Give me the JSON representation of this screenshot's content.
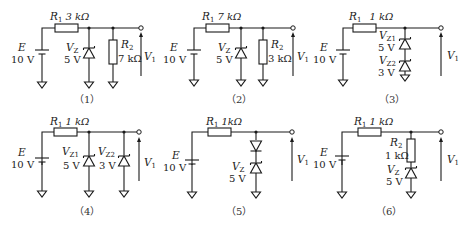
{
  "circuits": [
    {
      "caption": "（1）",
      "E_label": "E",
      "E_value": "10 V",
      "R1_label": "R",
      "R1_sub": "1",
      "R1_value": "3 kΩ",
      "Z_label": "V",
      "Z_sub": "Z",
      "Z_value": "5 V",
      "R2_label": "R",
      "R2_sub": "2",
      "R2_value": "7 kΩ",
      "Vout_label": "V",
      "Vout_sub": "1"
    },
    {
      "caption": "（2）",
      "E_label": "E",
      "E_value": "10 V",
      "R1_label": "R",
      "R1_sub": "1",
      "R1_value": "7 kΩ",
      "Z_label": "V",
      "Z_sub": "Z",
      "Z_value": "5 V",
      "R2_label": "R",
      "R2_sub": "2",
      "R2_value": "3 kΩ",
      "Vout_label": "V",
      "Vout_sub": "1"
    },
    {
      "caption": "（3）",
      "E_label": "E",
      "E_value": "10 V",
      "R1_label": "R",
      "R1_sub": "1",
      "R1_value": "1 kΩ",
      "Z1_label": "V",
      "Z1_sub": "Z1",
      "Z1_value": "5 V",
      "Z2_label": "V",
      "Z2_sub": "Z2",
      "Z2_value": "3 V",
      "Vout_label": "V",
      "Vout_sub": "1"
    },
    {
      "caption": "（4）",
      "E_label": "E",
      "E_value": "10 V",
      "R1_label": "R",
      "R1_sub": "1",
      "R1_value": "1 kΩ",
      "Z1_label": "V",
      "Z1_sub": "Z1",
      "Z1_value": "5 V",
      "Z2_label": "V",
      "Z2_sub": "Z2",
      "Z2_value": "3 V",
      "Vout_label": "V",
      "Vout_sub": "1"
    },
    {
      "caption": "（5）",
      "E_label": "E",
      "E_value": "10 V",
      "R1_label": "R",
      "R1_sub": "1",
      "R1_value": "1kΩ",
      "Z_label": "V",
      "Z_sub": "Z",
      "Z_value": "5 V",
      "Vout_label": "V",
      "Vout_sub": "1"
    },
    {
      "caption": "（6）",
      "E_label": "E",
      "E_value": "10 V",
      "R1_label": "R",
      "R1_sub": "1",
      "R1_value": "1 kΩ",
      "R2_label": "R",
      "R2_sub": "2",
      "R2_value": "1 kΩ",
      "Z_label": "V",
      "Z_sub": "Z",
      "Z_value": "5 V",
      "Vout_label": "V",
      "Vout_sub": "1"
    }
  ]
}
